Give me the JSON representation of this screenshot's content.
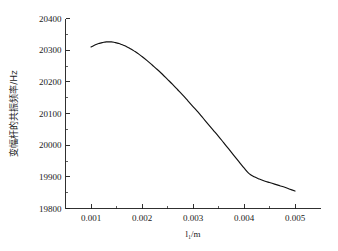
{
  "chart_data": {
    "type": "line",
    "title": "",
    "subtitle": "",
    "xlabel": "l₁/m",
    "ylabel": "变幅杆的共振频率/Hz",
    "xlim": [
      0.0005,
      0.0055
    ],
    "ylim": [
      19800,
      20400
    ],
    "grid": false,
    "legend": null,
    "x_ticks": [
      0.001,
      0.002,
      0.003,
      0.004,
      0.005
    ],
    "x_tick_labels": [
      "0.001",
      "0.002",
      "0.003",
      "0.004",
      "0.005"
    ],
    "x_minor_ticks": [
      0.0015,
      0.0025,
      0.0035,
      0.0045
    ],
    "y_ticks": [
      19800,
      19900,
      20000,
      20100,
      20200,
      20300,
      20400
    ],
    "y_tick_labels": [
      "19800",
      "19900",
      "20000",
      "20100",
      "20200",
      "20300",
      "20400"
    ],
    "y_minor_ticks": [
      19850,
      19950,
      20050,
      20150,
      20250,
      20350
    ],
    "series": [
      {
        "name": "resonance-frequency",
        "color": "#111111",
        "x": [
          0.001,
          0.00105,
          0.0011,
          0.00115,
          0.0012,
          0.00125,
          0.0013,
          0.00135,
          0.0014,
          0.00145,
          0.0015,
          0.00155,
          0.0016,
          0.00165,
          0.0017,
          0.00175,
          0.0018,
          0.00185,
          0.0019,
          0.00195,
          0.002,
          0.0021,
          0.0022,
          0.0023,
          0.0024,
          0.0025,
          0.0026,
          0.0027,
          0.0028,
          0.0029,
          0.003,
          0.0031,
          0.0032,
          0.0033,
          0.0034,
          0.0035,
          0.0036,
          0.0037,
          0.0038,
          0.0039,
          0.004,
          0.0041,
          0.0042,
          0.0043,
          0.0044,
          0.0045,
          0.0046,
          0.0047,
          0.0048,
          0.0049,
          0.005
        ],
        "y": [
          20310,
          20314,
          20318,
          20321,
          20323,
          20325,
          20326,
          20326,
          20326,
          20325,
          20323,
          20321,
          20318,
          20315,
          20311,
          20307,
          20302,
          20297,
          20292,
          20286,
          20280,
          20267,
          20253,
          20239,
          20224,
          20208,
          20192,
          20175,
          20158,
          20140,
          20122,
          20104,
          20085,
          20066,
          20047,
          20028,
          20008,
          19988,
          19968,
          19948,
          19928,
          19910,
          19900,
          19893,
          19887,
          19882,
          19877,
          19872,
          19867,
          19861,
          19855
        ]
      }
    ],
    "annotations": []
  }
}
